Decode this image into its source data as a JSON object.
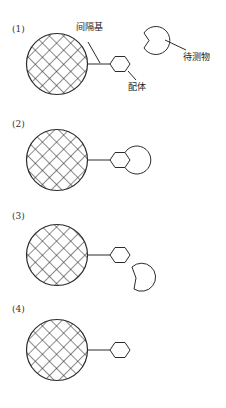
{
  "diagram": {
    "type": "affinity-binding schematic",
    "labels": {
      "spacer": "间隔基",
      "ligand": "配体",
      "analyte": "待测物"
    },
    "panels": [
      {
        "id": "panel-1",
        "label": "(1)",
        "state": "ligand and analyte separate (free analyte)"
      },
      {
        "id": "panel-2",
        "label": "(2)",
        "state": "analyte bound to ligand"
      },
      {
        "id": "panel-3",
        "label": "(3)",
        "state": "analyte dissociating from ligand"
      },
      {
        "id": "panel-4",
        "label": "(4)",
        "state": "ligand free, analyte removed"
      }
    ],
    "colors": {
      "line": "#2b2b2b",
      "background": "#ffffff"
    }
  }
}
